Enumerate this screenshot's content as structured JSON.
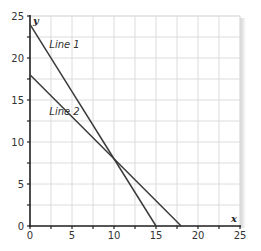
{
  "chart_data": {
    "type": "line",
    "title": "",
    "xlabel": "x",
    "ylabel": "y",
    "xlim": [
      0,
      25
    ],
    "ylim": [
      0,
      25
    ],
    "x_ticks": [
      0,
      5,
      10,
      15,
      20,
      25
    ],
    "y_ticks": [
      0,
      5,
      10,
      15,
      20,
      25
    ],
    "minor_tick_step": 2.5,
    "grid": true,
    "legend": "none (inline labels)",
    "series": [
      {
        "name": "Line 1",
        "points": [
          [
            0,
            24
          ],
          [
            15,
            0
          ]
        ],
        "label_at": [
          2.3,
          21.2
        ]
      },
      {
        "name": "Line 2",
        "points": [
          [
            0,
            18
          ],
          [
            18,
            0
          ]
        ],
        "label_at": [
          2.3,
          13.2
        ]
      }
    ],
    "intersection": [
      10,
      8
    ],
    "colors": {
      "line": "#3a3a3a",
      "axis": "#222222",
      "grid": "#dcdcdc",
      "shadow": "#d8d8d8"
    }
  },
  "labels": {
    "x_axis_name": "x",
    "y_axis_name": "y",
    "line1": "Line 1",
    "line2": "Line 2",
    "x_ticks": [
      "0",
      "5",
      "10",
      "15",
      "20",
      "25"
    ],
    "y_ticks": [
      "0",
      "5",
      "10",
      "15",
      "20",
      "25"
    ]
  }
}
